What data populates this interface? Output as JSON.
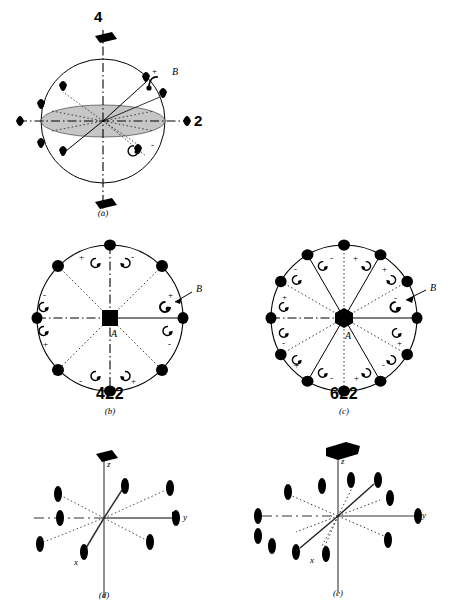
{
  "figure": {
    "panels": [
      {
        "id": "a",
        "caption": "(a)",
        "kind": "sphere-stereo",
        "labels": {
          "principal_axis": "4",
          "secondary_axis": "2",
          "pole_label": "B"
        },
        "symbols": {
          "principal_axis_symbol": "filled-parallelogram-4fold",
          "secondary_axis_symbol": "filled-lens-2fold",
          "equatorial_plane": "shaded-ellipse"
        },
        "signs": [
          "+",
          "-"
        ]
      },
      {
        "id": "b",
        "caption": "(b)",
        "kind": "stereogram",
        "group": "422",
        "center_symbol": "filled-square-4fold",
        "center_label": "A",
        "pole_label": "B",
        "axes_count": 8,
        "signs": [
          "+",
          "-",
          "-",
          "+",
          "-",
          "+",
          "+",
          "-"
        ]
      },
      {
        "id": "c",
        "caption": "(c)",
        "kind": "stereogram",
        "group": "622",
        "center_symbol": "filled-hexagon-6fold",
        "center_label": "A",
        "pole_label": "B",
        "axes_count": 12,
        "signs": [
          "+",
          "-",
          "+",
          "-",
          "+",
          "-",
          "+",
          "-",
          "+",
          "-",
          "+",
          "-"
        ]
      },
      {
        "id": "d",
        "caption": "(d)",
        "kind": "axes-3d",
        "group": "422",
        "axis_labels": {
          "z": "z",
          "x": "x",
          "y": "y"
        },
        "top_symbol": "filled-parallelogram-4fold",
        "lens_count": 8
      },
      {
        "id": "e",
        "caption": "(e)",
        "kind": "axes-3d",
        "group": "622",
        "axis_labels": {
          "z": "z",
          "x": "x",
          "y": "y"
        },
        "top_symbol": "filled-hexagon-6fold",
        "lens_count": 12
      }
    ]
  },
  "colors": {
    "ink": "#000000",
    "shade": "#c8c8c8",
    "grey_line": "#777777",
    "background": "#ffffff"
  }
}
